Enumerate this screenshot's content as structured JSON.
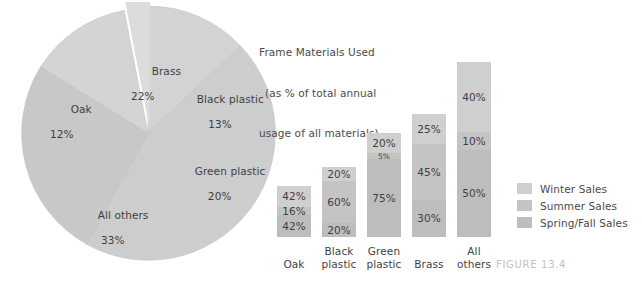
{
  "title": {
    "line1": "Frame Materials Used",
    "line2": "(as % of total annual",
    "line3": "usage of all materials)"
  },
  "figure_caption": "FIGURE 13.4",
  "legend": {
    "items": [
      {
        "label": "Winter Sales",
        "color": "#cfcfcf"
      },
      {
        "label": "Summer Sales",
        "color": "#c4c4c4"
      },
      {
        "label": "Spring/Fall Sales",
        "color": "#bdbdbd"
      }
    ]
  },
  "pie_labels": [
    {
      "name": "Brass",
      "pct": "22%",
      "x": 117,
      "y": 50
    },
    {
      "name": "Black plastic",
      "pct": "13%",
      "x": 162,
      "y": 78
    },
    {
      "name": "Oak",
      "pct": "12%",
      "x": 36,
      "y": 88
    },
    {
      "name": "Green plastic",
      "pct": "20%",
      "x": 160,
      "y": 150
    },
    {
      "name": "All others",
      "pct": "33%",
      "x": 63,
      "y": 194
    }
  ],
  "chart_data": [
    {
      "type": "pie",
      "title": "Frame Materials Used (as % of total annual usage of all materials)",
      "categories": [
        "Black plastic",
        "Green plastic",
        "All others",
        "Oak",
        "Brass"
      ],
      "values": [
        13,
        20,
        33,
        12,
        22
      ],
      "labels": [
        "Black plastic 13%",
        "Green plastic 20%",
        "All others 33%",
        "Oak 12%",
        "Brass 22%"
      ],
      "unit": "%",
      "exploded_slice": "Brass",
      "start_angle_deg": 0,
      "direction": "clockwise",
      "colors": [
        "#d2d2d2",
        "#cbcbcb",
        "#c6c6c6",
        "#d4d4d4",
        "#dcdcdc"
      ],
      "legend": "none",
      "grid": false
    },
    {
      "type": "bar",
      "subtype": "stacked-100",
      "title": "",
      "xlabel": "",
      "ylabel": "",
      "ylim": [
        0,
        100
      ],
      "grid": false,
      "legend_position": "right",
      "categories": [
        "Oak",
        "Black plastic",
        "Green plastic",
        "Brass",
        "All others"
      ],
      "bar_heights_pct_of_axis": [
        27,
        37,
        55,
        65,
        92
      ],
      "series": [
        {
          "name": "Winter Sales",
          "color": "#cfcfcf",
          "values": [
            42,
            20,
            20,
            25,
            40
          ]
        },
        {
          "name": "Summer Sales",
          "color": "#c4c4c4",
          "values": [
            16,
            60,
            5,
            45,
            10
          ]
        },
        {
          "name": "Spring/Fall Sales",
          "color": "#bdbdbd",
          "values": [
            42,
            20,
            75,
            30,
            50
          ]
        }
      ],
      "bars": [
        {
          "category": "Oak",
          "category_line1": "Oak",
          "category_line2": "",
          "segments": [
            {
              "series": "Winter Sales",
              "label": "42%",
              "value": 42
            },
            {
              "series": "Summer Sales",
              "label": "16%",
              "value": 16
            },
            {
              "series": "Spring/Fall Sales",
              "label": "42%",
              "value": 42
            }
          ]
        },
        {
          "category": "Black plastic",
          "category_line1": "Black",
          "category_line2": "plastic",
          "segments": [
            {
              "series": "Winter Sales",
              "label": "20%",
              "value": 20
            },
            {
              "series": "Summer Sales",
              "label": "60%",
              "value": 60
            },
            {
              "series": "Spring/Fall Sales",
              "label": "20%",
              "value": 20
            }
          ]
        },
        {
          "category": "Green plastic",
          "category_line1": "Green",
          "category_line2": "plastic",
          "segments": [
            {
              "series": "Winter Sales",
              "label": "20%",
              "value": 20
            },
            {
              "series": "Summer Sales",
              "label": "5%",
              "value": 5
            },
            {
              "series": "Spring/Fall Sales",
              "label": "75%",
              "value": 75
            }
          ]
        },
        {
          "category": "Brass",
          "category_line1": "Brass",
          "category_line2": "",
          "segments": [
            {
              "series": "Winter Sales",
              "label": "25%",
              "value": 25
            },
            {
              "series": "Summer Sales",
              "label": "45%",
              "value": 45
            },
            {
              "series": "Spring/Fall Sales",
              "label": "30%",
              "value": 30
            }
          ]
        },
        {
          "category": "All others",
          "category_line1": "All",
          "category_line2": "others",
          "segments": [
            {
              "series": "Winter Sales",
              "label": "40%",
              "value": 40
            },
            {
              "series": "Summer Sales",
              "label": "10%",
              "value": 10
            },
            {
              "series": "Spring/Fall Sales",
              "label": "50%",
              "value": 50
            }
          ]
        }
      ]
    }
  ]
}
